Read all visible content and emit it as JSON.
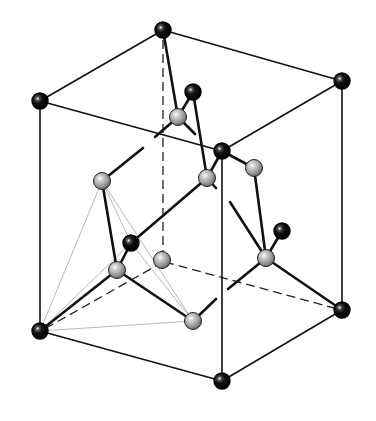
{
  "figure": {
    "title": "",
    "colors": {
      "corner_atom": "#111111",
      "interior_atom": "#9a9a9a",
      "bond": "#111111",
      "tetrahedron_guide": "#b8b8b8",
      "background": "#ffffff"
    }
  },
  "atoms": {
    "black": [
      {
        "id": "top-back",
        "x": 163,
        "y": 30
      },
      {
        "id": "top-left",
        "x": 40,
        "y": 101
      },
      {
        "id": "top-right",
        "x": 342,
        "y": 81
      },
      {
        "id": "top-front",
        "x": 222,
        "y": 151
      },
      {
        "id": "top-face-center",
        "x": 193,
        "y": 92
      },
      {
        "id": "left-face-center",
        "x": 131,
        "y": 243
      },
      {
        "id": "right-face-center",
        "x": 282,
        "y": 231
      },
      {
        "id": "bottom-left",
        "x": 40,
        "y": 331
      },
      {
        "id": "bottom-right",
        "x": 342,
        "y": 310
      },
      {
        "id": "bottom-front",
        "x": 222,
        "y": 381
      }
    ],
    "gray": [
      {
        "id": "g1",
        "x": 178,
        "y": 117
      },
      {
        "id": "g2",
        "x": 102,
        "y": 181
      },
      {
        "id": "g3",
        "x": 207,
        "y": 178
      },
      {
        "id": "g4",
        "x": 254,
        "y": 168
      },
      {
        "id": "g5",
        "x": 117,
        "y": 270
      },
      {
        "id": "g6",
        "x": 162,
        "y": 260
      },
      {
        "id": "g7",
        "x": 266,
        "y": 258
      },
      {
        "id": "g8",
        "x": 193,
        "y": 321
      }
    ]
  }
}
